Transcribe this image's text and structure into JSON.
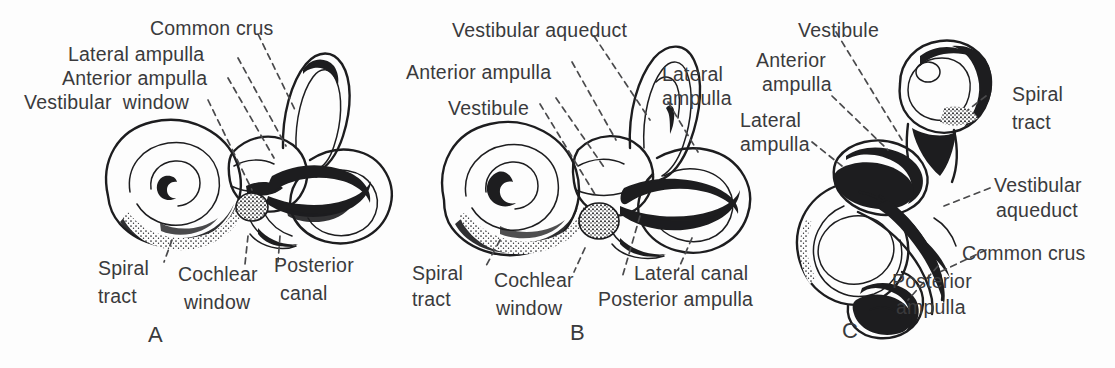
{
  "figure": {
    "background_color": "#fdfdfd",
    "ink_color": "#1d1d1f",
    "text_color": "#3a3a3c",
    "panel_letters": [
      "A",
      "B",
      "C"
    ]
  },
  "panel_a": {
    "letter": "A",
    "labels": {
      "common_crus": "Common crus",
      "lateral_ampulla": "Lateral ampulla",
      "anterior_ampulla": "Anterior ampulla",
      "vestibular_window": "Vestibular  window",
      "spiral_tract_line1": "Spiral",
      "spiral_tract_line2": "tract",
      "cochlear_window_line1": "Cochlear",
      "cochlear_window_line2": "window",
      "posterior_canal_line1": "Posterior",
      "posterior_canal_line2": "canal"
    }
  },
  "panel_b": {
    "letter": "B",
    "labels": {
      "vestibular_aqueduct": "Vestibular aqueduct",
      "anterior_ampulla": "Anterior ampulla",
      "vestibule": "Vestibule",
      "lateral_ampulla_line1": "Lateral",
      "lateral_ampulla_line2": "ampulla",
      "spiral_tract_line1": "Spiral",
      "spiral_tract_line2": "tract",
      "cochlear_window_line1": "Cochlear",
      "cochlear_window_line2": "window",
      "lateral_canal": "Lateral canal",
      "posterior_ampulla": "Posterior ampulla"
    }
  },
  "panel_c": {
    "letter": "C",
    "labels": {
      "vestibule": "Vestibule",
      "anterior_ampulla_line1": "Anterior",
      "anterior_ampulla_line2": "ampulla",
      "lateral_ampulla_line1": "Lateral",
      "lateral_ampulla_line2": "ampulla",
      "spiral_tract_line1": "Spiral",
      "spiral_tract_line2": "tract",
      "vestibular_aqueduct_line1": "Vestibular",
      "vestibular_aqueduct_line2": "aqueduct",
      "common_crus": "Common crus",
      "posterior_ampulla_line1": "Posterior",
      "posterior_ampulla_line2": "ampulla"
    }
  }
}
